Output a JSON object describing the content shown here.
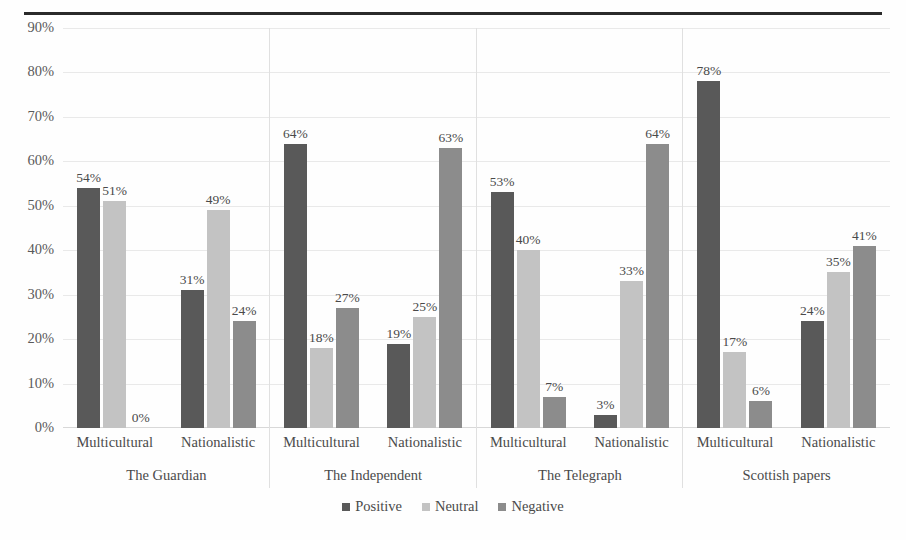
{
  "chart_data": {
    "type": "bar",
    "title": "",
    "xlabel": "",
    "ylabel": "",
    "ylim": [
      0,
      90
    ],
    "grid": true,
    "legend_position": "bottom",
    "y_ticks": [
      "0%",
      "10%",
      "20%",
      "30%",
      "40%",
      "50%",
      "60%",
      "70%",
      "80%",
      "90%"
    ],
    "y_tick_values": [
      0,
      10,
      20,
      30,
      40,
      50,
      60,
      70,
      80,
      90
    ],
    "series_names": [
      "Positive",
      "Neutral",
      "Negative"
    ],
    "series_colors": [
      "#595959",
      "#c3c3c3",
      "#8c8c8c"
    ],
    "group_level_1": [
      "The Guardian",
      "The Independent",
      "The Telegraph",
      "Scottish papers"
    ],
    "group_level_2": [
      "Multicultural",
      "Nationalistic"
    ],
    "categories": [
      "The Guardian - Multicultural",
      "The Guardian - Nationalistic",
      "The Independent - Multicultural",
      "The Independent - Nationalistic",
      "The Telegraph - Multicultural",
      "The Telegraph - Nationalistic",
      "Scottish papers - Multicultural",
      "Scottish papers - Nationalistic"
    ],
    "series": [
      {
        "name": "Positive",
        "values": [
          54,
          31,
          64,
          19,
          53,
          3,
          78,
          24
        ]
      },
      {
        "name": "Neutral",
        "values": [
          51,
          49,
          18,
          25,
          40,
          33,
          17,
          35
        ]
      },
      {
        "name": "Negative",
        "values": [
          0,
          24,
          27,
          63,
          7,
          64,
          6,
          41
        ]
      }
    ],
    "groups": [
      {
        "paper": "The Guardian",
        "frames": [
          {
            "frame": "Multicultural",
            "bars": [
              {
                "series": "Positive",
                "value": 54,
                "label": "54%"
              },
              {
                "series": "Neutral",
                "value": 51,
                "label": "51%"
              },
              {
                "series": "Negative",
                "value": 0,
                "label": "0%"
              }
            ]
          },
          {
            "frame": "Nationalistic",
            "bars": [
              {
                "series": "Positive",
                "value": 31,
                "label": "31%"
              },
              {
                "series": "Neutral",
                "value": 49,
                "label": "49%"
              },
              {
                "series": "Negative",
                "value": 24,
                "label": "24%"
              }
            ]
          }
        ]
      },
      {
        "paper": "The Independent",
        "frames": [
          {
            "frame": "Multicultural",
            "bars": [
              {
                "series": "Positive",
                "value": 64,
                "label": "64%"
              },
              {
                "series": "Neutral",
                "value": 18,
                "label": "18%"
              },
              {
                "series": "Negative",
                "value": 27,
                "label": "27%"
              }
            ]
          },
          {
            "frame": "Nationalistic",
            "bars": [
              {
                "series": "Positive",
                "value": 19,
                "label": "19%"
              },
              {
                "series": "Neutral",
                "value": 25,
                "label": "25%"
              },
              {
                "series": "Negative",
                "value": 63,
                "label": "63%"
              }
            ]
          }
        ]
      },
      {
        "paper": "The Telegraph",
        "frames": [
          {
            "frame": "Multicultural",
            "bars": [
              {
                "series": "Positive",
                "value": 53,
                "label": "53%"
              },
              {
                "series": "Neutral",
                "value": 40,
                "label": "40%"
              },
              {
                "series": "Negative",
                "value": 7,
                "label": "7%"
              }
            ]
          },
          {
            "frame": "Nationalistic",
            "bars": [
              {
                "series": "Positive",
                "value": 3,
                "label": "3%"
              },
              {
                "series": "Neutral",
                "value": 33,
                "label": "33%"
              },
              {
                "series": "Negative",
                "value": 64,
                "label": "64%"
              }
            ]
          }
        ]
      },
      {
        "paper": "Scottish papers",
        "frames": [
          {
            "frame": "Multicultural",
            "bars": [
              {
                "series": "Positive",
                "value": 78,
                "label": "78%"
              },
              {
                "series": "Neutral",
                "value": 17,
                "label": "17%"
              },
              {
                "series": "Negative",
                "value": 6,
                "label": "6%"
              }
            ]
          },
          {
            "frame": "Nationalistic",
            "bars": [
              {
                "series": "Positive",
                "value": 24,
                "label": "24%"
              },
              {
                "series": "Neutral",
                "value": 35,
                "label": "35%"
              },
              {
                "series": "Negative",
                "value": 41,
                "label": "41%"
              }
            ]
          }
        ]
      }
    ],
    "legend": [
      {
        "label": "Positive",
        "color": "#595959"
      },
      {
        "label": "Neutral",
        "color": "#c3c3c3"
      },
      {
        "label": "Negative",
        "color": "#8c8c8c"
      }
    ]
  }
}
